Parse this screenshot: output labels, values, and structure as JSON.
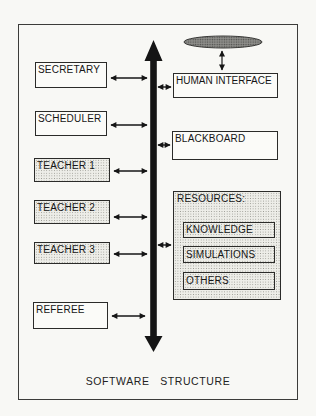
{
  "figure": {
    "caption": "SOFTWARE STRUCTURE",
    "left_column": [
      {
        "label": "SECRETARY"
      },
      {
        "label": "SCHEDULER"
      },
      {
        "label": "TEACHER 1"
      },
      {
        "label": "TEACHER 2"
      },
      {
        "label": "TEACHER 3"
      },
      {
        "label": "REFEREE"
      }
    ],
    "right_column": [
      {
        "label": "HUMAN INTERFACE"
      },
      {
        "label": "BLACKBOARD"
      }
    ],
    "resources_group": {
      "title": "RESOURCES:",
      "items": [
        {
          "label": "KNOWLEDGE"
        },
        {
          "label": "SIMULATIONS"
        },
        {
          "label": "OTHERS"
        }
      ]
    },
    "icons": {
      "user_ellipse": "stippled-ellipse",
      "bus": "double-headed-vertical-arrow"
    },
    "colors": {
      "ink": "#1b1b1b",
      "paper": "#f8f8f5",
      "stipple_fill": "#edede8",
      "ellipse_fill": "#8e8e8a"
    }
  }
}
